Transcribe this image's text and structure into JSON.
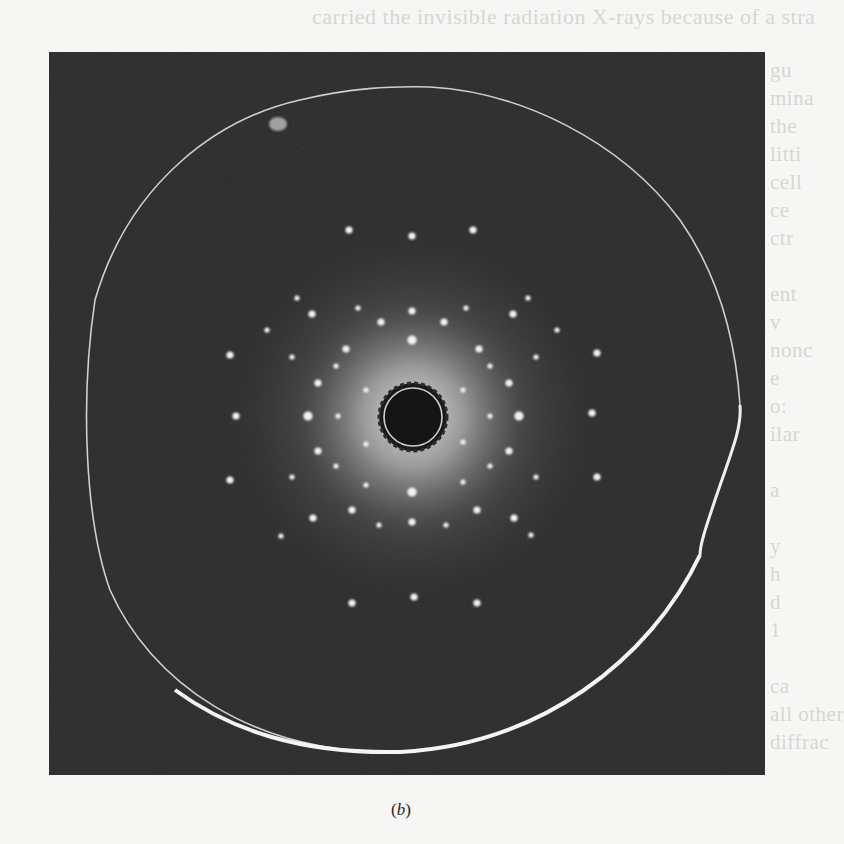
{
  "figure": {
    "caption": "(b)",
    "caption_parts": {
      "open": "(",
      "letter": "b",
      "close": ")"
    }
  },
  "bleed_through_text": {
    "top_line": "carried the invisible radiation X-rays because of a stra",
    "right_margin": [
      "gu",
      "mina",
      "the",
      "litti",
      "cell",
      "ce",
      "ctr",
      "",
      "ent",
      "v",
      "nonc",
      "e",
      "o:",
      "ilar",
      "",
      "a",
      "",
      "y",
      "h",
      "d",
      "1",
      "",
      "ca",
      "all other",
      "diffrac"
    ]
  },
  "colors": {
    "paper": "#f6f6f4",
    "film_background": "#2a2a2a",
    "spot": "#f2f2f2",
    "glow": "#d8d8d8",
    "beam_stop": "#151515"
  },
  "center": {
    "x": 413,
    "y": 417,
    "beam_stop_radius": 33
  },
  "spots": [
    {
      "x": 349,
      "y": 230,
      "r": 3
    },
    {
      "x": 412,
      "y": 236,
      "r": 3
    },
    {
      "x": 473,
      "y": 230,
      "r": 3
    },
    {
      "x": 297,
      "y": 298,
      "r": 2
    },
    {
      "x": 528,
      "y": 298,
      "r": 2
    },
    {
      "x": 358,
      "y": 308,
      "r": 2
    },
    {
      "x": 412,
      "y": 311,
      "r": 3
    },
    {
      "x": 466,
      "y": 308,
      "r": 2
    },
    {
      "x": 312,
      "y": 314,
      "r": 3
    },
    {
      "x": 513,
      "y": 314,
      "r": 3
    },
    {
      "x": 381,
      "y": 322,
      "r": 3
    },
    {
      "x": 444,
      "y": 322,
      "r": 3
    },
    {
      "x": 267,
      "y": 330,
      "r": 2
    },
    {
      "x": 557,
      "y": 330,
      "r": 2
    },
    {
      "x": 412,
      "y": 340,
      "r": 4
    },
    {
      "x": 346,
      "y": 349,
      "r": 3
    },
    {
      "x": 479,
      "y": 349,
      "r": 3
    },
    {
      "x": 230,
      "y": 355,
      "r": 3
    },
    {
      "x": 597,
      "y": 353,
      "r": 3
    },
    {
      "x": 292,
      "y": 357,
      "r": 2
    },
    {
      "x": 536,
      "y": 357,
      "r": 2
    },
    {
      "x": 336,
      "y": 366,
      "r": 2
    },
    {
      "x": 490,
      "y": 366,
      "r": 2
    },
    {
      "x": 318,
      "y": 383,
      "r": 3
    },
    {
      "x": 509,
      "y": 383,
      "r": 3
    },
    {
      "x": 366,
      "y": 390,
      "r": 2
    },
    {
      "x": 463,
      "y": 390,
      "r": 2
    },
    {
      "x": 236,
      "y": 416,
      "r": 3
    },
    {
      "x": 308,
      "y": 416,
      "r": 4
    },
    {
      "x": 338,
      "y": 416,
      "r": 2
    },
    {
      "x": 490,
      "y": 416,
      "r": 2
    },
    {
      "x": 519,
      "y": 416,
      "r": 4
    },
    {
      "x": 592,
      "y": 413,
      "r": 3
    },
    {
      "x": 366,
      "y": 444,
      "r": 2
    },
    {
      "x": 463,
      "y": 442,
      "r": 2
    },
    {
      "x": 318,
      "y": 451,
      "r": 3
    },
    {
      "x": 509,
      "y": 451,
      "r": 3
    },
    {
      "x": 336,
      "y": 466,
      "r": 2
    },
    {
      "x": 490,
      "y": 466,
      "r": 2
    },
    {
      "x": 230,
      "y": 480,
      "r": 3
    },
    {
      "x": 597,
      "y": 477,
      "r": 3
    },
    {
      "x": 292,
      "y": 477,
      "r": 2
    },
    {
      "x": 536,
      "y": 477,
      "r": 2
    },
    {
      "x": 366,
      "y": 485,
      "r": 2
    },
    {
      "x": 463,
      "y": 482,
      "r": 2
    },
    {
      "x": 412,
      "y": 492,
      "r": 4
    },
    {
      "x": 352,
      "y": 510,
      "r": 3
    },
    {
      "x": 477,
      "y": 510,
      "r": 3
    },
    {
      "x": 313,
      "y": 518,
      "r": 3
    },
    {
      "x": 514,
      "y": 518,
      "r": 3
    },
    {
      "x": 412,
      "y": 522,
      "r": 3
    },
    {
      "x": 379,
      "y": 525,
      "r": 2
    },
    {
      "x": 446,
      "y": 525,
      "r": 2
    },
    {
      "x": 281,
      "y": 536,
      "r": 2
    },
    {
      "x": 531,
      "y": 535,
      "r": 2
    },
    {
      "x": 352,
      "y": 603,
      "r": 3
    },
    {
      "x": 414,
      "y": 597,
      "r": 3
    },
    {
      "x": 477,
      "y": 603,
      "r": 3
    }
  ]
}
